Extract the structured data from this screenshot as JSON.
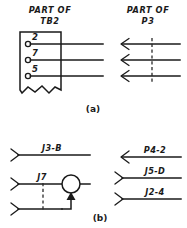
{
  "diagram": {
    "title_left_a": "PART OF",
    "subtitle_left_a": "TB2",
    "title_right_a": "PART OF",
    "subtitle_right_a": "P3",
    "figure_a_label": "(a)",
    "figure_b_label": "(b)",
    "ink_color": "#1a1a1a",
    "background_color": "#ffffff"
  },
  "section_a": {
    "terminal_block": {
      "name": "TB2",
      "terminals": [
        {
          "number": "2"
        },
        {
          "number": "7"
        },
        {
          "number": "5"
        }
      ]
    },
    "connector": {
      "name": "P3",
      "arrow_direction": "left",
      "arrow_count": 3,
      "has_dashed_crossline": true
    }
  },
  "section_b": {
    "left_wires": [
      {
        "label": "J3-B",
        "arrow_direction": "right"
      },
      {
        "label": "J7",
        "arrow_direction": "right"
      },
      {
        "label": "",
        "arrow_direction": "right"
      }
    ],
    "left_device": {
      "symbol": "circle",
      "has_dashed_link": true,
      "has_filled_arrow": true
    },
    "right_wires": [
      {
        "label": "P4-2",
        "arrow_direction": "left"
      },
      {
        "label": "J5-D",
        "arrow_direction": "right"
      },
      {
        "label": "J2-4",
        "arrow_direction": "right"
      }
    ]
  }
}
